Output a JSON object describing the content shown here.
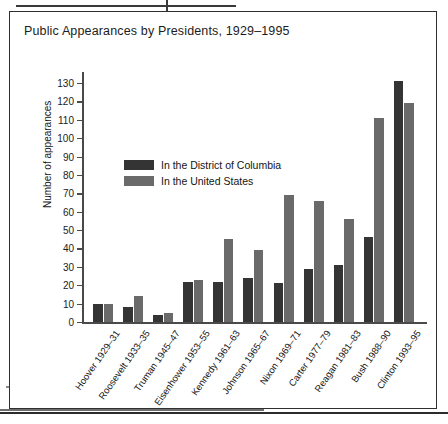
{
  "figure": {
    "title": "Public Appearances by Presidents, 1929–1995"
  },
  "legend": {
    "series": [
      {
        "key": "dc",
        "label": "In the District of Columbia",
        "color": "#343434"
      },
      {
        "key": "us",
        "label": "In the United States",
        "color": "#6a6a6a"
      }
    ]
  },
  "axes": {
    "ylabel": "Number of appearances",
    "yticks": [
      0,
      10,
      20,
      30,
      40,
      50,
      60,
      70,
      80,
      90,
      100,
      110,
      120,
      130
    ]
  },
  "chart_data": {
    "type": "bar",
    "title": "Public Appearances by Presidents, 1929–1995",
    "xlabel": "",
    "ylabel": "Number of appearances",
    "ylim": [
      0,
      136
    ],
    "ytick_step": 10,
    "grid": false,
    "legend_position": "upper-left-inside",
    "categories": [
      "Hoover 1929–31",
      "Roosevelt 1933–35",
      "Truman 1945–47",
      "Eisenhower 1953–55",
      "Kennedy 1961–63",
      "Johnson 1965–67",
      "Nixon 1969–71",
      "Carter 1977–79",
      "Reagan 1981–83",
      "Bush 1988–90",
      "Clinton 1993–95"
    ],
    "series": [
      {
        "name": "In the District of Columbia",
        "color": "#343434",
        "values": [
          10,
          8,
          4,
          22,
          22,
          24,
          21,
          29,
          31,
          46,
          131
        ]
      },
      {
        "name": "In the United States",
        "color": "#6a6a6a",
        "values": [
          10,
          14,
          5,
          23,
          45,
          39,
          69,
          66,
          56,
          111,
          119
        ]
      }
    ]
  }
}
